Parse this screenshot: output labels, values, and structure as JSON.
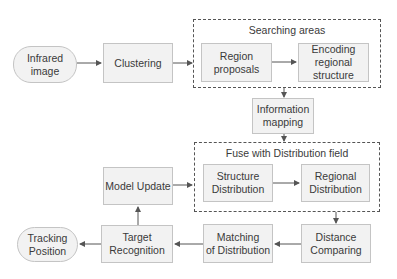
{
  "diagram": {
    "groups": [
      {
        "id": "searching-areas",
        "title": "Searching areas"
      },
      {
        "id": "fuse-field",
        "title": "Fuse with Distribution field"
      }
    ],
    "nodes": [
      {
        "id": "infrared-image",
        "label": "Infrared\nimage",
        "shape": "terminal"
      },
      {
        "id": "clustering",
        "label": "Clustering",
        "shape": "process"
      },
      {
        "id": "region-proposals",
        "label": "Region\nproposals",
        "shape": "process"
      },
      {
        "id": "encoding-regional-structure",
        "label": "Encoding\nregional\nstructure",
        "shape": "process"
      },
      {
        "id": "information-mapping",
        "label": "Information\nmapping",
        "shape": "process"
      },
      {
        "id": "structure-distribution",
        "label": "Structure\nDistribution",
        "shape": "process"
      },
      {
        "id": "regional-distribution",
        "label": "Regional\nDistribution",
        "shape": "process"
      },
      {
        "id": "distance-comparing",
        "label": "Distance\nComparing",
        "shape": "process"
      },
      {
        "id": "matching-of-distribution",
        "label": "Matching\nof Distribution",
        "shape": "process"
      },
      {
        "id": "target-recognition",
        "label": "Target\nRecognition",
        "shape": "process"
      },
      {
        "id": "model-update",
        "label": "Model Update",
        "shape": "process"
      },
      {
        "id": "tracking-position",
        "label": "Tracking\nPosition",
        "shape": "terminal"
      }
    ],
    "edges": [
      {
        "from": "infrared-image",
        "to": "clustering"
      },
      {
        "from": "clustering",
        "to": "searching-areas"
      },
      {
        "from": "region-proposals",
        "to": "encoding-regional-structure"
      },
      {
        "from": "searching-areas",
        "to": "information-mapping"
      },
      {
        "from": "information-mapping",
        "to": "fuse-field"
      },
      {
        "from": "structure-distribution",
        "to": "regional-distribution"
      },
      {
        "from": "fuse-field",
        "to": "distance-comparing"
      },
      {
        "from": "distance-comparing",
        "to": "matching-of-distribution"
      },
      {
        "from": "matching-of-distribution",
        "to": "target-recognition"
      },
      {
        "from": "target-recognition",
        "to": "tracking-position"
      },
      {
        "from": "target-recognition",
        "to": "model-update"
      },
      {
        "from": "model-update",
        "to": "fuse-field"
      }
    ],
    "colors": {
      "node_fill": "#f2f2f2",
      "node_border": "#c4c4c4",
      "line": "#555555",
      "text": "#3a3a3a"
    }
  }
}
